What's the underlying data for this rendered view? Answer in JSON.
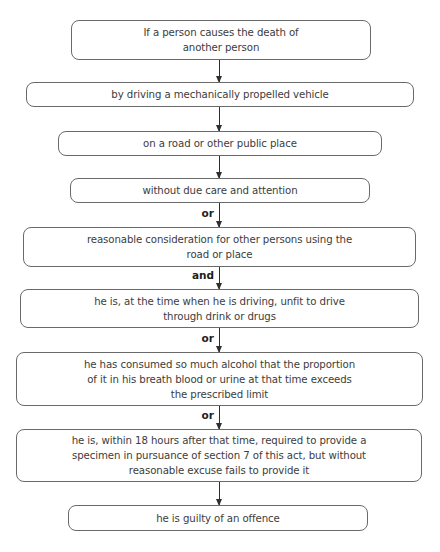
{
  "diagram": {
    "type": "flowchart",
    "direction": "top-to-bottom",
    "boxes": [
      {
        "id": "b1",
        "lines": [
          "If a person causes the death of",
          "another person"
        ]
      },
      {
        "id": "b2",
        "lines": [
          "by driving a mechanically propelled vehicle"
        ]
      },
      {
        "id": "b3",
        "lines": [
          "on a road or other public place"
        ]
      },
      {
        "id": "b4",
        "lines": [
          "without due care and attention"
        ]
      },
      {
        "id": "b5",
        "lines": [
          "reasonable consideration for other persons using the",
          "road or place"
        ]
      },
      {
        "id": "b6",
        "lines": [
          "he is, at the time when he is driving, unfit to drive",
          "through drink or drugs"
        ]
      },
      {
        "id": "b7",
        "lines": [
          "he has consumed so much alcohol that the proportion",
          "of it in his breath blood or urine at that time exceeds",
          "the prescribed limit"
        ]
      },
      {
        "id": "b8",
        "lines": [
          "he is, within 18 hours after that time, required to provide a",
          "specimen in pursuance of section 7 of this act, but without",
          "reasonable excuse fails to provide it"
        ]
      },
      {
        "id": "b9",
        "lines": [
          "he is guilty of an offence"
        ]
      }
    ],
    "connectors": [
      {
        "from": "b1",
        "to": "b2",
        "label": ""
      },
      {
        "from": "b2",
        "to": "b3",
        "label": ""
      },
      {
        "from": "b3",
        "to": "b4",
        "label": ""
      },
      {
        "from": "b4",
        "to": "b5",
        "label": "or"
      },
      {
        "from": "b5",
        "to": "b6",
        "label": "and"
      },
      {
        "from": "b6",
        "to": "b7",
        "label": "or"
      },
      {
        "from": "b7",
        "to": "b8",
        "label": "or"
      },
      {
        "from": "b8",
        "to": "b9",
        "label": ""
      }
    ]
  }
}
